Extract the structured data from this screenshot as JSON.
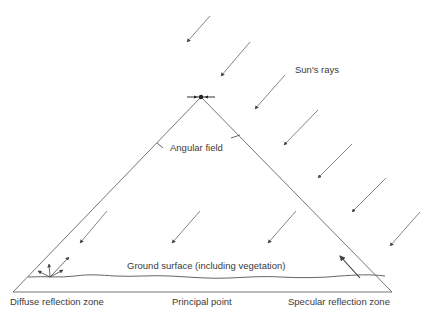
{
  "diagram": {
    "labels": {
      "suns_rays": "Sun's rays",
      "angular_field": "Angular field",
      "ground_surface": "Ground surface (including vegetation)",
      "diffuse_zone": "Diffuse reflection zone",
      "principal_point": "Principal point",
      "specular_zone": "Specular reflection zone"
    },
    "colors": {
      "line": "#555555",
      "text": "#3a3a3a",
      "background": "#ffffff"
    }
  }
}
